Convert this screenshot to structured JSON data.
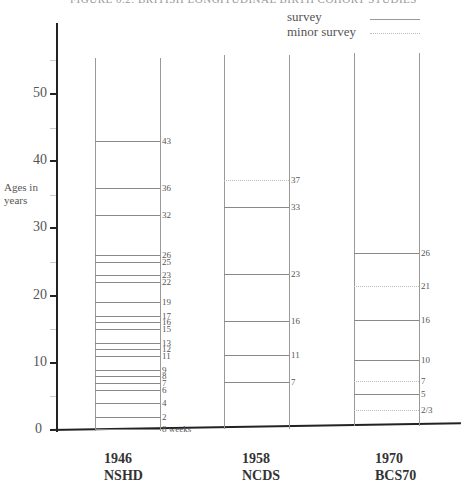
{
  "title": "FIGURE 0.2: BRITISH LONGITUDINAL BIRTH COHORT STUDIES",
  "legend": {
    "survey_label": "survey",
    "minor_label": "minor survey"
  },
  "y_axis": {
    "title_line1": "Ages in",
    "title_line2": "years",
    "ticks": [
      "0",
      "10",
      "20",
      "30",
      "40",
      "50"
    ]
  },
  "cohorts": [
    {
      "year": "1946",
      "name": "NSHD"
    },
    {
      "year": "1958",
      "name": "NCDS"
    },
    {
      "year": "1970",
      "name": "BCS70"
    }
  ],
  "chart_data": {
    "type": "diagram",
    "ylabel": "Ages in years",
    "ylim": [
      0,
      55
    ],
    "yticks": [
      0,
      10,
      20,
      30,
      40,
      50
    ],
    "legend": [
      "survey (solid line)",
      "minor survey (dotted line)"
    ],
    "categories": [
      "1946 NSHD",
      "1958 NCDS",
      "1970 BCS70"
    ],
    "series": [
      {
        "name": "1946 NSHD",
        "surveys": [
          {
            "label": "8 weeks",
            "age": 0.15,
            "type": "survey"
          },
          {
            "label": "2",
            "age": 2,
            "type": "survey"
          },
          {
            "label": "4",
            "age": 4,
            "type": "survey"
          },
          {
            "label": "6",
            "age": 6,
            "type": "survey"
          },
          {
            "label": "7",
            "age": 7,
            "type": "survey"
          },
          {
            "label": "8",
            "age": 8,
            "type": "survey"
          },
          {
            "label": "9",
            "age": 9,
            "type": "survey"
          },
          {
            "label": "11",
            "age": 11,
            "type": "survey"
          },
          {
            "label": "12",
            "age": 12,
            "type": "survey"
          },
          {
            "label": "13",
            "age": 13,
            "type": "survey"
          },
          {
            "label": "15",
            "age": 15,
            "type": "survey"
          },
          {
            "label": "16",
            "age": 16,
            "type": "survey"
          },
          {
            "label": "17",
            "age": 17,
            "type": "survey"
          },
          {
            "label": "19",
            "age": 19,
            "type": "survey"
          },
          {
            "label": "22",
            "age": 22,
            "type": "survey"
          },
          {
            "label": "23",
            "age": 23,
            "type": "survey"
          },
          {
            "label": "25",
            "age": 25,
            "type": "survey"
          },
          {
            "label": "26",
            "age": 26,
            "type": "survey"
          },
          {
            "label": "32",
            "age": 32,
            "type": "survey"
          },
          {
            "label": "36",
            "age": 36,
            "type": "survey"
          },
          {
            "label": "43",
            "age": 43,
            "type": "survey"
          }
        ]
      },
      {
        "name": "1958 NCDS",
        "surveys": [
          {
            "label": "7",
            "age": 7,
            "type": "survey"
          },
          {
            "label": "11",
            "age": 11,
            "type": "survey"
          },
          {
            "label": "16",
            "age": 16,
            "type": "survey"
          },
          {
            "label": "23",
            "age": 23,
            "type": "survey"
          },
          {
            "label": "33",
            "age": 33,
            "type": "survey"
          },
          {
            "label": "37",
            "age": 37,
            "type": "minor"
          }
        ]
      },
      {
        "name": "1970 BCS70",
        "surveys": [
          {
            "label": "2/3",
            "age": 2.6,
            "type": "minor"
          },
          {
            "label": "5",
            "age": 5,
            "type": "survey"
          },
          {
            "label": "7",
            "age": 7,
            "type": "minor"
          },
          {
            "label": "10",
            "age": 10,
            "type": "survey"
          },
          {
            "label": "16",
            "age": 16,
            "type": "survey"
          },
          {
            "label": "21",
            "age": 21,
            "type": "minor"
          },
          {
            "label": "26",
            "age": 26,
            "type": "survey"
          }
        ]
      }
    ]
  }
}
